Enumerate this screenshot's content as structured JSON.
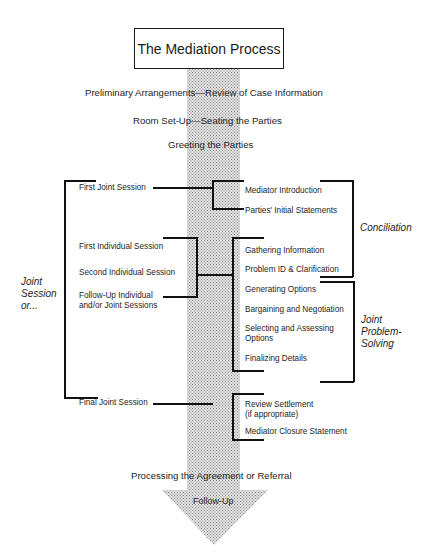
{
  "diagram": {
    "title": "The Mediation Process",
    "stages": [
      "Preliminary Arrangements—Review of Case Information",
      "Room Set-Up—Seating the Parties",
      "Greeting the Parties",
      "Processing the Agreement or Referral",
      "Follow-Up"
    ],
    "left_group_label": "Joint\nSession\nor...",
    "sessions": [
      "First Joint Session",
      "First Individual Session",
      "Second Individual Session",
      "Follow-Up Individual\nand/or Joint Sessions",
      "Final Joint Session"
    ],
    "steps": [
      "Mediator Introduction",
      "Parties' Initial Statements",
      "Gathering Information",
      "Problem ID & Clarification",
      "Generating Options",
      "Bargaining and Negotiation",
      "Selecting and Assessing\nOptions",
      "Finalizing Details",
      "Review Settlement\n(if appropriate)",
      "Mediator Closure Statement"
    ],
    "phases": [
      "Conciliation",
      "Joint\nProblem-\nSolving"
    ],
    "colors": {
      "arrow_fill": "#c8c8c8",
      "line": "#111111",
      "text": "#1e1e1e"
    }
  }
}
